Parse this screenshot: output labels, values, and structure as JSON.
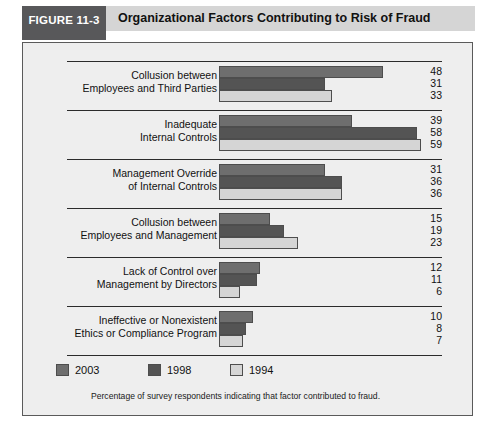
{
  "header": {
    "tab_label": "FIGURE 11-3",
    "title": "Organizational Factors Contributing to Risk of Fraud"
  },
  "footnote": "Percentage of survey respondents indicating that factor contributed to fraud.",
  "legend": {
    "items": [
      {
        "label": "2003",
        "color": "#6e6e6e"
      },
      {
        "label": "1998",
        "color": "#545454"
      },
      {
        "label": "1994",
        "color": "#d5d5d5"
      }
    ]
  },
  "chart_data": {
    "type": "bar",
    "orientation": "horizontal",
    "title": "Organizational Factors Contributing to Risk of Fraud",
    "xlabel": "Percentage of survey respondents indicating that factor contributed to fraud.",
    "ylabel": "",
    "xlim": [
      0,
      60
    ],
    "grid": false,
    "legend_position": "bottom-left",
    "categories": [
      "Collusion between Employees and Third Parties",
      "Inadequate Internal Controls",
      "Management Override of Internal Controls",
      "Collusion between Employees and Management",
      "Lack of Control over Management by Directors",
      "Ineffective or Nonexistent Ethics or Compliance Program"
    ],
    "category_lines": [
      [
        "Collusion between",
        "Employees and Third Parties"
      ],
      [
        "Inadequate",
        "Internal Controls"
      ],
      [
        "Management Override",
        "of Internal Controls"
      ],
      [
        "Collusion between",
        "Employees and Management"
      ],
      [
        "Lack of Control over",
        "Management by Directors"
      ],
      [
        "Ineffective or Nonexistent",
        "Ethics or Compliance Program"
      ]
    ],
    "series": [
      {
        "name": "2003",
        "color": "#6e6e6e",
        "values": [
          48,
          39,
          31,
          15,
          12,
          10
        ]
      },
      {
        "name": "1998",
        "color": "#545454",
        "values": [
          31,
          58,
          36,
          19,
          11,
          8
        ]
      },
      {
        "name": "1994",
        "color": "#d5d5d5",
        "values": [
          33,
          59,
          36,
          23,
          6,
          7
        ]
      }
    ]
  }
}
